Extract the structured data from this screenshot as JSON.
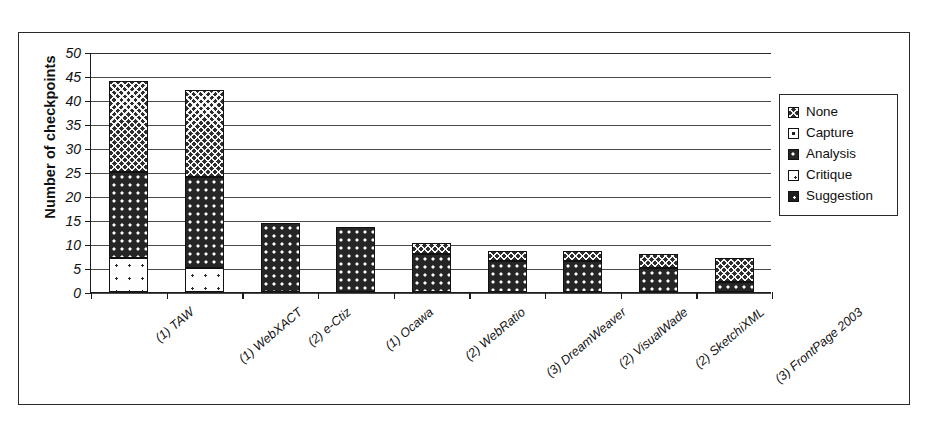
{
  "chart_data": {
    "type": "bar",
    "subtype": "stacked-column",
    "title": "",
    "xlabel": "",
    "ylabel": "Number of checkpoints",
    "ylim": [
      0,
      50
    ],
    "ytick_step": 5,
    "yticks": [
      "0",
      "5",
      "10",
      "15",
      "20",
      "25",
      "30",
      "35",
      "40",
      "45",
      "50"
    ],
    "grid": true,
    "legend_position": "right",
    "categories": [
      "(1) TAW",
      "(1) WebXACT",
      "(2) e-Ctiz",
      "(1) Ocawa",
      "(2) WebRatio",
      "(3) DreamWeaver",
      "(2) VisualWade",
      "(2) SketchiXML",
      "(3) FrontPage 2003"
    ],
    "series": [
      {
        "name": "Suggestion",
        "values": [
          0,
          0,
          0,
          0,
          0,
          0,
          0,
          0,
          0
        ]
      },
      {
        "name": "Critique",
        "values": [
          7,
          5,
          0,
          0,
          0,
          0,
          0,
          0,
          0
        ]
      },
      {
        "name": "Analysis",
        "values": [
          18,
          19,
          14.3,
          13.5,
          8,
          6.5,
          6.5,
          5,
          2
        ]
      },
      {
        "name": "Capture",
        "values": [
          0,
          0,
          0,
          0,
          0,
          0,
          0,
          0,
          0
        ]
      },
      {
        "name": "None",
        "values": [
          19,
          18,
          0,
          0,
          2.3,
          2,
          2,
          3,
          5
        ]
      }
    ],
    "totals": [
      44,
      42,
      14.3,
      13.5,
      10.3,
      8.5,
      8.5,
      8,
      7
    ]
  },
  "legend": {
    "items": [
      {
        "label": "None",
        "fill": "fill-none"
      },
      {
        "label": "Capture",
        "fill": "fill-capture"
      },
      {
        "label": "Analysis",
        "fill": "fill-analysis"
      },
      {
        "label": "Critique",
        "fill": "fill-critique"
      },
      {
        "label": "Suggestion",
        "fill": "fill-suggestion"
      }
    ]
  },
  "colors": {
    "axis": "#1c1c1c",
    "grid": "#4a4a4a",
    "frame": "#2a2a2a",
    "ink": "#111111",
    "paper": "#ffffff"
  }
}
